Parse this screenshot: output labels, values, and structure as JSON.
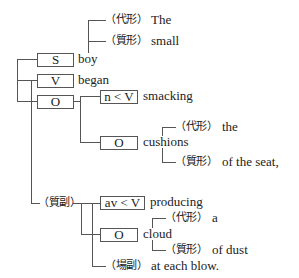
{
  "diagram": {
    "subject": {
      "role": "S",
      "word": "boy",
      "modifiers": [
        {
          "tag": "（代形）",
          "word": "The"
        },
        {
          "tag": "（質形）",
          "word": "small"
        }
      ]
    },
    "verb": {
      "role": "V",
      "word": "began"
    },
    "object": {
      "role": "O",
      "verbal": {
        "role": "n < V",
        "word": "smacking"
      },
      "object": {
        "role": "O",
        "word": "cushions",
        "modifiers": [
          {
            "tag": "（代形）",
            "word": "the"
          },
          {
            "tag": "（質形）",
            "word": "of the seat,"
          }
        ]
      }
    },
    "adverbial": {
      "tag": "（質副）",
      "verbal": {
        "role": "av < V",
        "word": "producing"
      },
      "object": {
        "role": "O",
        "word": "cloud",
        "modifiers": [
          {
            "tag": "（代形）",
            "word": "a"
          },
          {
            "tag": "（質形）",
            "word": "of dust"
          }
        ]
      },
      "place": {
        "tag": "（場副）",
        "word": "at each blow."
      }
    }
  },
  "colors": {
    "line": "#555555",
    "text": "#222222",
    "background": "#ffffff"
  }
}
